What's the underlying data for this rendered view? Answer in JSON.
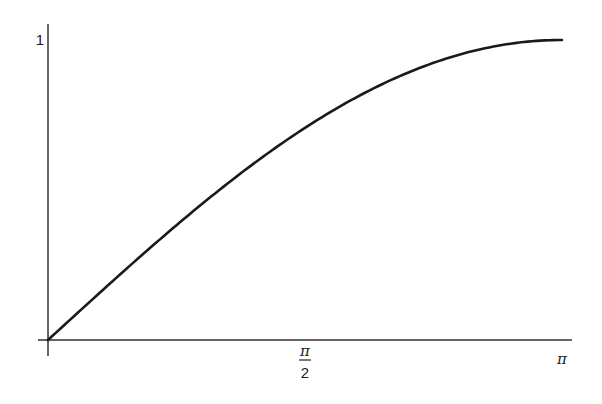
{
  "chart_data": {
    "type": "line",
    "title": "",
    "xlabel": "",
    "ylabel": "",
    "function": "y = sin(x/2)",
    "xlim": [
      0,
      3.14159
    ],
    "ylim": [
      0,
      1
    ],
    "grid": false,
    "legend": null,
    "x_ticks": [
      {
        "value": 1.5708,
        "label_num": "π",
        "label_den": "2"
      },
      {
        "value": 3.14159,
        "label": "π"
      }
    ],
    "y_ticks": [
      {
        "value": 1,
        "label": "1"
      }
    ],
    "series": [
      {
        "name": "sin(x/2)",
        "color": "#1a1a1a",
        "x": [
          0,
          0.3142,
          0.6283,
          0.9425,
          1.2566,
          1.5708,
          1.885,
          2.1991,
          2.5133,
          2.8274,
          3.1416
        ],
        "y": [
          0,
          0.1564,
          0.309,
          0.454,
          0.5878,
          0.7071,
          0.809,
          0.891,
          0.9511,
          0.9877,
          1.0
        ]
      }
    ]
  },
  "labels": {
    "y_one": "1",
    "x_half_pi_num": "π",
    "x_half_pi_den": "2",
    "x_pi": "π"
  },
  "colors": {
    "axis": "#333333",
    "curve": "#1a1a1a",
    "text": "#222222"
  }
}
